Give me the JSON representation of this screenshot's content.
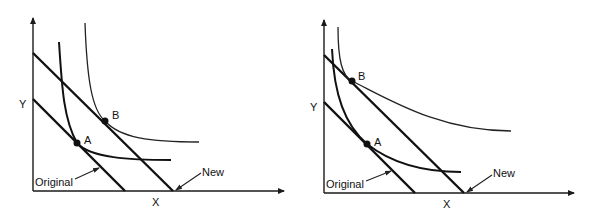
{
  "diagrams": [
    {
      "id": "left",
      "axis_labels": {
        "x": "X",
        "y": "Y"
      },
      "points": [
        {
          "label": "A"
        },
        {
          "label": "B"
        }
      ],
      "budget_lines": [
        {
          "label": "Original"
        },
        {
          "label": "New"
        }
      ],
      "description": "Parallel outward shift of budget line; optimum moves from A to B on a higher indifference curve"
    },
    {
      "id": "right",
      "axis_labels": {
        "x": "X",
        "y": "Y"
      },
      "points": [
        {
          "label": "A"
        },
        {
          "label": "B"
        }
      ],
      "budget_lines": [
        {
          "label": "Original"
        },
        {
          "label": "New"
        }
      ],
      "description": "Parallel outward shift of budget line; optimum moves from A to B with much more Y and less X"
    }
  ]
}
